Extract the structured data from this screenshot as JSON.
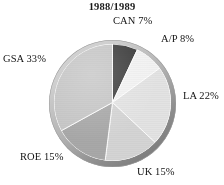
{
  "chart_data": {
    "type": "pie",
    "title": "1988/1989",
    "xlabel": "",
    "ylabel": "",
    "grid": false,
    "legend_position": "none",
    "label_format": "{name} {value}%",
    "start_angle_deg": 0,
    "direction": "clockwise",
    "categories": [
      "CAN",
      "A/P",
      "LA",
      "UK",
      "ROE",
      "GSA"
    ],
    "values": [
      7,
      8,
      22,
      15,
      15,
      33
    ],
    "total": 100,
    "slices": [
      {
        "name": "CAN",
        "value": 7,
        "label": "CAN 7%",
        "color": "#3d3d3d",
        "start_deg": 0,
        "end_deg": 25.2
      },
      {
        "name": "A/P",
        "value": 8,
        "label": "A/P 8%",
        "color": "#f2f2f2",
        "start_deg": 25.2,
        "end_deg": 54.0
      },
      {
        "name": "LA",
        "value": 22,
        "label": "LA 22%",
        "color": "#e3e3e3",
        "start_deg": 54.0,
        "end_deg": 133.2
      },
      {
        "name": "UK",
        "value": 15,
        "label": "UK 15%",
        "color": "#d4d4d4",
        "start_deg": 133.2,
        "end_deg": 187.2
      },
      {
        "name": "ROE",
        "value": 15,
        "label": "ROE 15%",
        "color": "#a8a8a8",
        "start_deg": 187.2,
        "end_deg": 241.2
      },
      {
        "name": "GSA",
        "value": 33,
        "label": "GSA 33%",
        "color": "#c6c6c6",
        "start_deg": 241.2,
        "end_deg": 360.0
      }
    ],
    "colors": {
      "background": "#ffffff",
      "text": "#141414",
      "rim_light": "#d2d2d2",
      "rim_dark": "#7c7c7c",
      "slice_divider": "#ffffff"
    }
  }
}
